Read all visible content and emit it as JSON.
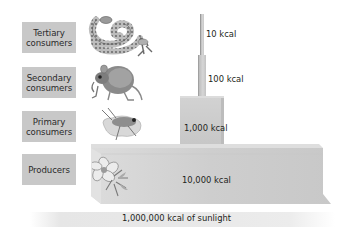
{
  "diagram": {
    "levels": [
      {
        "name": "Tertiary consumers",
        "line1": "Tertiary",
        "line2": "consumers",
        "energy": "10 kcal",
        "organism": "snake-icon"
      },
      {
        "name": "Secondary consumers",
        "line1": "Secondary",
        "line2": "consumers",
        "energy": "100 kcal",
        "organism": "mouse-icon"
      },
      {
        "name": "Primary consumers",
        "line1": "Primary",
        "line2": "consumers",
        "energy": "1,000 kcal",
        "organism": "grasshopper-icon"
      },
      {
        "name": "Producers",
        "line1": "Producers",
        "line2": "",
        "energy": "10,000 kcal",
        "organism": "flower-icon"
      }
    ],
    "sunlight": "1,000,000 kcal of sunlight",
    "colors": {
      "label_box": "#c8c8c8",
      "block": "#cccccc",
      "sunlight_band": "#e8e8e8",
      "text": "#231f20"
    }
  }
}
